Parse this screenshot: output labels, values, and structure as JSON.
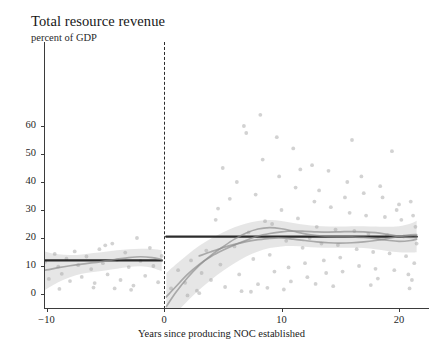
{
  "title": "Total resource revenue",
  "subtitle": "percent of GDP",
  "axis": {
    "x_title": "Years since producing NOC established",
    "x_ticks": [
      "−10",
      "0",
      "10",
      "20"
    ],
    "y_ticks": [
      "0",
      "10",
      "20",
      "30",
      "40",
      "50",
      "60"
    ]
  },
  "colors": {
    "fit_line": "#1a1a1a",
    "lowess": "#8e8e8e",
    "ci_band": "#d6d6d6",
    "scatter": "#a6a6a6",
    "axis": "#3b3b3b",
    "cutoff": "#2b2b2b",
    "background": "#ffffff"
  },
  "chart_data": {
    "type": "scatter",
    "title": "Total resource revenue",
    "subtitle": "percent of GDP",
    "xlabel": "Years since producing NOC established",
    "ylabel": "percent of GDP",
    "xlim": [
      -11.5,
      22.5
    ],
    "ylim": [
      0,
      67
    ],
    "x_tickvals": [
      -10,
      0,
      10,
      20
    ],
    "y_tickvals": [
      0,
      10,
      20,
      30,
      40,
      50,
      60
    ],
    "grid": false,
    "legend": "none",
    "cutoff_x": 0,
    "annotations": [
      "vertical dashed line at x = 0 (producing NOC established)"
    ],
    "series": [
      {
        "name": "RD fit - left of cutoff",
        "type": "line",
        "style": "solid-thick-black",
        "x": [
          -11.0,
          -5.5,
          -0.2
        ],
        "y": [
          12.0,
          12.0,
          12.0
        ]
      },
      {
        "name": "RD fit - right of cutoff",
        "type": "line",
        "style": "solid-thick-black",
        "x": [
          0.2,
          10.0,
          21.5
        ],
        "y": [
          20.5,
          20.5,
          20.5
        ]
      },
      {
        "name": "Local polynomial (lowess) - left",
        "type": "line",
        "style": "solid-grey",
        "x": [
          -11.0,
          -10.0,
          -9.0,
          -8.0,
          -7.0,
          -6.0,
          -5.0,
          -4.0,
          -3.0,
          -2.0,
          -1.0,
          -0.2
        ],
        "y": [
          7.9,
          8.6,
          9.4,
          10.1,
          10.7,
          11.2,
          11.8,
          12.4,
          13.0,
          13.3,
          13.0,
          12.3
        ]
      },
      {
        "name": "Local polynomial (lowess) A - right",
        "type": "line",
        "style": "solid-grey",
        "x": [
          0.2,
          1.0,
          2.0,
          3.0,
          4.0,
          5.0,
          6.0,
          7.0,
          8.0,
          9.0,
          10.0,
          11.0,
          12.0,
          13.0,
          14.0,
          15.0,
          16.0,
          17.0,
          18.0,
          19.0,
          20.0,
          21.0,
          21.5
        ],
        "y": [
          -4.5,
          0.5,
          5.8,
          10.2,
          13.8,
          16.8,
          19.6,
          21.8,
          23.2,
          23.7,
          23.3,
          22.4,
          21.5,
          20.9,
          20.6,
          20.5,
          20.4,
          20.2,
          19.8,
          19.2,
          18.8,
          19.1,
          19.6
        ]
      },
      {
        "name": "Local polynomial (lowess) B - right",
        "type": "line",
        "style": "solid-grey",
        "x": [
          0.2,
          1.0,
          2.0,
          3.0,
          4.0,
          5.0,
          6.0,
          7.0,
          8.0,
          9.0,
          10.0,
          11.0,
          12.0,
          13.0,
          14.0,
          15.0,
          16.0,
          17.0,
          18.0,
          19.0,
          20.0,
          21.0,
          21.5
        ],
        "y": [
          -1.0,
          2.6,
          7.0,
          10.6,
          13.4,
          15.6,
          17.5,
          19.2,
          20.7,
          21.6,
          22.2,
          22.5,
          22.4,
          22.2,
          22.1,
          22.2,
          22.3,
          22.2,
          21.9,
          21.3,
          20.6,
          20.2,
          20.2
        ]
      },
      {
        "name": "Local polynomial (lowess) C - right",
        "type": "line",
        "style": "solid-grey",
        "x": [
          3.0,
          4.0,
          5.0,
          6.0,
          7.0,
          8.0,
          9.0,
          10.0,
          11.0,
          12.0,
          13.0,
          14.0,
          15.0,
          16.0,
          17.0,
          18.0,
          19.0,
          20.0,
          21.0,
          21.5
        ],
        "y": [
          13.6,
          15.1,
          16.5,
          17.7,
          18.7,
          19.4,
          19.9,
          20.0,
          19.6,
          19.1,
          18.6,
          18.3,
          18.2,
          18.3,
          18.6,
          19.1,
          19.8,
          20.6,
          21.1,
          21.2
        ]
      }
    ],
    "confidence_bands": [
      {
        "name": "CI - left",
        "x": [
          -11.0,
          -10.0,
          -9.0,
          -8.0,
          -7.0,
          -6.0,
          -5.0,
          -4.0,
          -3.0,
          -2.0,
          -1.0,
          -0.2
        ],
        "upper": [
          16.8,
          15.0,
          14.2,
          13.9,
          14.1,
          14.6,
          15.1,
          15.6,
          16.0,
          16.2,
          16.1,
          15.7
        ],
        "lower": [
          -1.2,
          1.8,
          4.2,
          6.0,
          7.2,
          7.9,
          8.4,
          9.0,
          9.6,
          9.9,
          9.3,
          8.2
        ]
      },
      {
        "name": "CI - right",
        "x": [
          0.2,
          1.0,
          2.0,
          3.0,
          4.0,
          5.0,
          6.0,
          7.0,
          8.0,
          9.0,
          10.0,
          11.0,
          12.0,
          13.0,
          14.0,
          15.0,
          16.0,
          17.0,
          18.0,
          19.0,
          20.0,
          21.0,
          21.5
        ],
        "upper": [
          7.5,
          10.5,
          14.0,
          17.2,
          19.8,
          22.0,
          23.8,
          25.2,
          26.1,
          26.4,
          26.1,
          25.4,
          24.7,
          24.3,
          24.1,
          24.1,
          24.2,
          24.2,
          24.1,
          24.0,
          24.2,
          25.2,
          26.2
        ],
        "lower": [
          -11.5,
          -7.0,
          -2.5,
          1.5,
          5.0,
          8.2,
          11.0,
          13.4,
          15.2,
          16.4,
          17.0,
          17.1,
          16.9,
          16.6,
          16.5,
          16.5,
          16.5,
          16.4,
          16.0,
          15.4,
          14.9,
          14.8,
          14.9
        ]
      }
    ],
    "points": [
      [
        -10.6,
        13.0
      ],
      [
        -10.4,
        8.6
      ],
      [
        -10.1,
        11.5
      ],
      [
        -9.8,
        5.4
      ],
      [
        -9.3,
        14.3
      ],
      [
        -9.0,
        9.8
      ],
      [
        -8.7,
        7.2
      ],
      [
        -8.3,
        12.6
      ],
      [
        -8.0,
        4.6
      ],
      [
        -7.6,
        15.2
      ],
      [
        -7.3,
        10.3
      ],
      [
        -7.0,
        6.1
      ],
      [
        -6.6,
        13.4
      ],
      [
        -6.2,
        8.9
      ],
      [
        -5.9,
        3.9
      ],
      [
        -5.5,
        16.0
      ],
      [
        -5.2,
        11.0
      ],
      [
        -4.8,
        7.0
      ],
      [
        -4.4,
        18.0
      ],
      [
        -4.0,
        12.2
      ],
      [
        -3.7,
        5.0
      ],
      [
        -3.3,
        14.8
      ],
      [
        -3.0,
        9.6
      ],
      [
        -2.6,
        3.0
      ],
      [
        -2.3,
        20.0
      ],
      [
        -2.0,
        11.8
      ],
      [
        -1.6,
        6.5
      ],
      [
        -1.2,
        16.5
      ],
      [
        -0.9,
        10.0
      ],
      [
        -0.5,
        4.2
      ],
      [
        -0.2,
        13.6
      ],
      [
        -6.0,
        2.3
      ],
      [
        -4.2,
        2.0
      ],
      [
        -8.9,
        1.8
      ],
      [
        -2.8,
        1.5
      ],
      [
        -5.0,
        17.4
      ],
      [
        0.6,
        2.0
      ],
      [
        1.2,
        8.5
      ],
      [
        1.8,
        4.0
      ],
      [
        2.3,
        12.0
      ],
      [
        2.8,
        1.2
      ],
      [
        3.2,
        7.5
      ],
      [
        3.6,
        15.5
      ],
      [
        4.0,
        5.0
      ],
      [
        4.4,
        26.5
      ],
      [
        4.8,
        10.5
      ],
      [
        5.2,
        2.5
      ],
      [
        5.6,
        34.0
      ],
      [
        6.0,
        17.0
      ],
      [
        6.4,
        7.0
      ],
      [
        6.8,
        60.0
      ],
      [
        7.0,
        57.5
      ],
      [
        7.2,
        22.0
      ],
      [
        7.6,
        12.5
      ],
      [
        8.0,
        3.5
      ],
      [
        8.2,
        64.0
      ],
      [
        8.4,
        48.0
      ],
      [
        8.6,
        26.0
      ],
      [
        9.0,
        14.0
      ],
      [
        9.4,
        8.0
      ],
      [
        9.6,
        56.0
      ],
      [
        9.8,
        42.0
      ],
      [
        10.0,
        30.0
      ],
      [
        10.4,
        19.0
      ],
      [
        10.6,
        9.5
      ],
      [
        10.8,
        4.5
      ],
      [
        11.0,
        52.0
      ],
      [
        11.2,
        38.0
      ],
      [
        11.4,
        27.0
      ],
      [
        11.8,
        16.5
      ],
      [
        12.0,
        11.0
      ],
      [
        12.2,
        6.0
      ],
      [
        12.6,
        46.0
      ],
      [
        12.8,
        33.0
      ],
      [
        13.0,
        24.0
      ],
      [
        13.4,
        18.0
      ],
      [
        13.6,
        12.0
      ],
      [
        13.8,
        7.5
      ],
      [
        14.0,
        44.0
      ],
      [
        14.2,
        31.0
      ],
      [
        14.6,
        23.0
      ],
      [
        14.8,
        17.5
      ],
      [
        15.0,
        13.0
      ],
      [
        15.2,
        8.0
      ],
      [
        15.6,
        40.0
      ],
      [
        15.8,
        29.0
      ],
      [
        16.0,
        55.0
      ],
      [
        16.2,
        22.5
      ],
      [
        16.4,
        16.0
      ],
      [
        16.6,
        10.0
      ],
      [
        17.0,
        36.0
      ],
      [
        17.2,
        28.0
      ],
      [
        17.4,
        21.5
      ],
      [
        17.8,
        15.0
      ],
      [
        18.0,
        9.0
      ],
      [
        18.2,
        5.5
      ],
      [
        18.6,
        34.5
      ],
      [
        18.8,
        27.5
      ],
      [
        19.0,
        21.0
      ],
      [
        19.2,
        14.5
      ],
      [
        19.4,
        51.0
      ],
      [
        19.6,
        8.5
      ],
      [
        20.0,
        32.0
      ],
      [
        20.2,
        26.5
      ],
      [
        20.4,
        20.5
      ],
      [
        20.6,
        13.5
      ],
      [
        20.8,
        7.0
      ],
      [
        21.0,
        33.0
      ],
      [
        21.2,
        28.0
      ],
      [
        21.4,
        24.0
      ],
      [
        21.5,
        18.0
      ],
      [
        21.3,
        11.0
      ],
      [
        21.1,
        5.0
      ],
      [
        5.0,
        45.0
      ],
      [
        6.2,
        40.0
      ],
      [
        7.8,
        35.5
      ],
      [
        9.2,
        25.0
      ],
      [
        12.4,
        20.0
      ],
      [
        4.6,
        30.5
      ],
      [
        16.8,
        42.0
      ],
      [
        18.4,
        38.5
      ],
      [
        13.2,
        37.0
      ],
      [
        11.6,
        44.5
      ],
      [
        19.8,
        30.0
      ],
      [
        15.4,
        34.5
      ],
      [
        2.0,
        -0.5
      ],
      [
        3.0,
        0.3
      ],
      [
        6.6,
        1.0
      ],
      [
        8.8,
        2.2
      ],
      [
        10.2,
        1.6
      ],
      [
        14.4,
        2.8
      ],
      [
        17.6,
        3.2
      ],
      [
        20.9,
        2.0
      ],
      [
        12.9,
        3.6
      ],
      [
        7.4,
        0.8
      ]
    ]
  }
}
